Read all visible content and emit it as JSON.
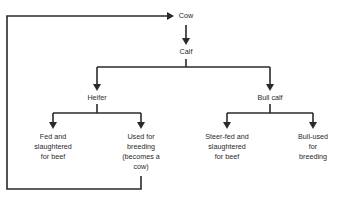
{
  "diagram": {
    "colors": {
      "line": "#2a2a2a",
      "text": "#2a2a2a",
      "background": "#ffffff"
    },
    "nodes": {
      "cow": "Cow",
      "calf": "Calf",
      "heifer": "Heifer",
      "bull_calf": "Bull calf",
      "heifer_beef": "Fed and\nslaughtered\nfor beef",
      "heifer_breeding": "Used for\nbreeding\n(becomes a\ncow)",
      "steer_beef": "Steer-fed and\nslaughtered\nfor beef",
      "bull_breeding": "Bull-used\nfor breeding"
    },
    "edges": [
      {
        "from": "cow",
        "to": "calf"
      },
      {
        "from": "calf",
        "to": "heifer"
      },
      {
        "from": "calf",
        "to": "bull_calf"
      },
      {
        "from": "heifer",
        "to": "heifer_beef"
      },
      {
        "from": "heifer",
        "to": "heifer_breeding"
      },
      {
        "from": "bull_calf",
        "to": "steer_beef"
      },
      {
        "from": "bull_calf",
        "to": "bull_breeding"
      },
      {
        "from": "heifer_breeding",
        "to": "cow",
        "type": "feedback-loop"
      }
    ]
  }
}
